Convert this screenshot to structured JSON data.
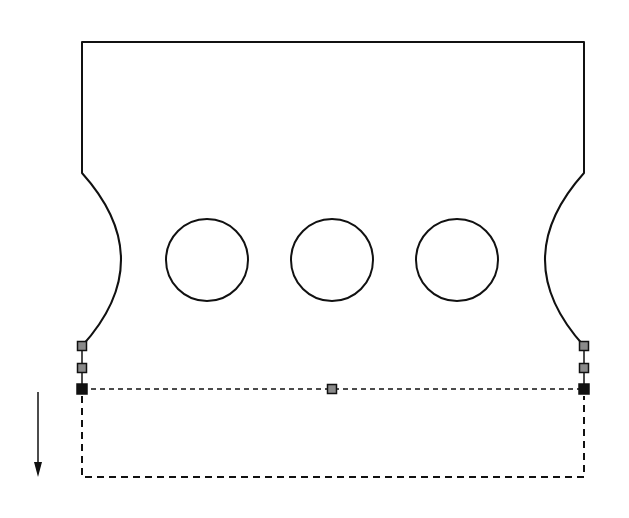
{
  "diagram": {
    "colors": {
      "stroke": "#111111",
      "handle_grey": "#8a8a8a",
      "handle_black": "#111111",
      "background": "#ffffff"
    },
    "outline": {
      "top_y": 42,
      "left_x": 82,
      "right_x": 584,
      "notch_start_y": 173,
      "notch_end_y": 346,
      "notch_depth_x": 48
    },
    "holes": [
      {
        "cx": 207,
        "cy": 260,
        "r": 41
      },
      {
        "cx": 332,
        "cy": 260,
        "r": 41
      },
      {
        "cx": 457,
        "cy": 260,
        "r": 41
      }
    ],
    "handles": [
      {
        "name": "left-top-grey",
        "x": 82,
        "y": 346,
        "type": "grey"
      },
      {
        "name": "left-mid-grey",
        "x": 82,
        "y": 368,
        "type": "grey"
      },
      {
        "name": "left-corner-black",
        "x": 82,
        "y": 389,
        "type": "black"
      },
      {
        "name": "center-grey",
        "x": 332,
        "y": 389,
        "type": "grey"
      },
      {
        "name": "right-top-grey",
        "x": 584,
        "y": 346,
        "type": "grey"
      },
      {
        "name": "right-mid-grey",
        "x": 584,
        "y": 368,
        "type": "grey"
      },
      {
        "name": "right-corner-black",
        "x": 584,
        "y": 389,
        "type": "black"
      }
    ],
    "preview_box": {
      "x1": 82,
      "y1": 389,
      "x2": 584,
      "y2": 477
    },
    "direction_arrow": {
      "x": 38,
      "y1": 392,
      "y2": 476,
      "direction": "down"
    }
  }
}
